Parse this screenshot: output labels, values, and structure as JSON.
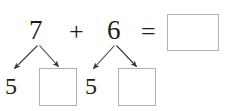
{
  "worksheet": {
    "type": "math-number-bond-worksheet",
    "equation": {
      "first_addend": "7",
      "operator_plus": "+",
      "second_addend": "6",
      "operator_equals": "=",
      "answer_box_value": ""
    },
    "decompositions": [
      {
        "source": "7",
        "known_part": "5",
        "unknown_part_box_value": ""
      },
      {
        "source": "6",
        "known_part": "5",
        "unknown_part_box_value": ""
      }
    ],
    "colors": {
      "text": "#1c1c1c",
      "box_border": "#b0b0b0",
      "arrow": "#3a3a3a",
      "background": "#ffffff"
    }
  }
}
